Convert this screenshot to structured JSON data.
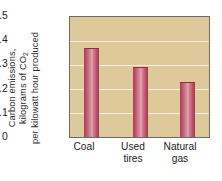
{
  "chart_data": {
    "type": "bar",
    "title": "",
    "subtitle": "",
    "xlabel": "",
    "ylabel": "Carbon emissions, kilograms of CO2 per kilowatt hour produced",
    "ylabel_lines": [
      {
        "pre": "Carbon emissions,",
        "sub": "",
        "post": ""
      },
      {
        "pre": "kilograms of CO",
        "sub": "2",
        "post": ""
      },
      {
        "pre": "per kilowatt hour produced",
        "sub": "",
        "post": ""
      }
    ],
    "categories": [
      "Coal",
      "Used tires",
      "Natural gas"
    ],
    "category_lines": [
      [
        "Coal"
      ],
      [
        "Used",
        "tires"
      ],
      [
        "Natural",
        "gas"
      ]
    ],
    "values": [
      0.37,
      0.29,
      0.23
    ],
    "ylim": [
      0,
      0.5
    ],
    "yticks": [
      0.5,
      0.4,
      0.3,
      0.2,
      0.1,
      0
    ],
    "ytick_labels": [
      "0.5",
      "0.4",
      "0.3",
      "0.2",
      "0.1",
      "0"
    ],
    "grid": true,
    "grid_color": "#f6eed8",
    "legend": false,
    "plot_background": "#dec99b",
    "figure_background": "#ffffff",
    "bar_color": "#c2607a",
    "bar_edge_color": "#8e2f41",
    "axis_color": "#6d6a60",
    "text_color": "#1c1c1c"
  }
}
